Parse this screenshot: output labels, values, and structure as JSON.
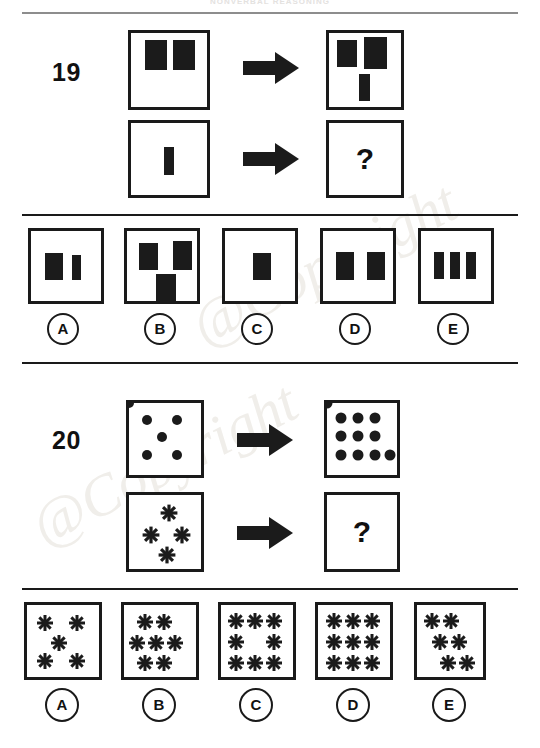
{
  "page": {
    "header_text": "NONVERBAL REASONING",
    "watermark_text": "@Copyright"
  },
  "questions": [
    {
      "number": "19",
      "prompt_symbol": "?",
      "arrow_icon": "right-arrow-icon",
      "rows": [
        {
          "label": "example-row",
          "source": {
            "shapes": "two wide rectangles side by side, top"
          },
          "result": {
            "shapes": "two wide rectangles top, one narrow bar below"
          }
        },
        {
          "label": "question-row",
          "source": {
            "shapes": "one narrow bar, centered"
          },
          "result": {
            "shapes": "unknown"
          }
        }
      ],
      "options": [
        {
          "letter": "A",
          "shapes": "one wide rectangle and one narrow bar"
        },
        {
          "letter": "B",
          "shapes": "two wide rectangles top, one wide rectangle below"
        },
        {
          "letter": "C",
          "shapes": "one wide rectangle centered"
        },
        {
          "letter": "D",
          "shapes": "two wide rectangles side by side"
        },
        {
          "letter": "E",
          "shapes": "three narrow bars side by side"
        }
      ]
    },
    {
      "number": "20",
      "prompt_symbol": "?",
      "arrow_icon": "right-arrow-icon",
      "rows": [
        {
          "label": "example-row",
          "source": {
            "glyph": "dot",
            "count": 5,
            "arrangement": "quincunx"
          },
          "result": {
            "glyph": "dot",
            "count": 10,
            "arrangement": "3-3-4 grid"
          }
        },
        {
          "label": "question-row",
          "source": {
            "glyph": "flower",
            "count": 4,
            "arrangement": "diamond"
          },
          "result": {
            "glyph": "flower",
            "count": 0,
            "arrangement": "unknown"
          }
        }
      ],
      "options": [
        {
          "letter": "A",
          "glyph": "flower",
          "count": 5,
          "arrangement": "quincunx"
        },
        {
          "letter": "B",
          "glyph": "flower",
          "count": 7,
          "arrangement": "2-3-2"
        },
        {
          "letter": "C",
          "glyph": "flower",
          "count": 8,
          "arrangement": "3-2-3 ring"
        },
        {
          "letter": "D",
          "glyph": "flower",
          "count": 9,
          "arrangement": "3-3-3 grid"
        },
        {
          "letter": "E",
          "glyph": "flower",
          "count": 6,
          "arrangement": "2-2-2 staggered"
        }
      ]
    }
  ],
  "colors": {
    "ink": "#1b1b1b",
    "rule": "#8d8d8d",
    "paper": "#ffffff",
    "watermark": "#f0eeea"
  }
}
